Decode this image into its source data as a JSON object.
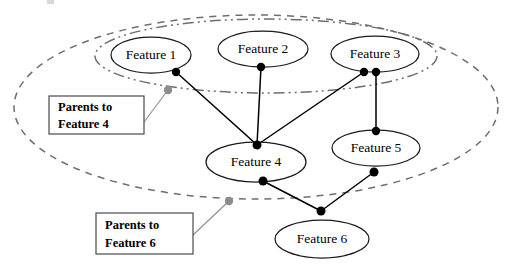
{
  "figure": {
    "kind": "bayesian-network-diagram",
    "width": 516,
    "height": 269,
    "background_color": "#ffffff"
  },
  "nodes": [
    {
      "id": "feature1",
      "label": "Feature 1",
      "cx": 151,
      "cy": 55,
      "rx": 40,
      "ry": 18
    },
    {
      "id": "feature2",
      "label": "Feature 2",
      "cx": 263,
      "cy": 49,
      "rx": 45,
      "ry": 18
    },
    {
      "id": "feature3",
      "label": "Feature 3",
      "cx": 375,
      "cy": 54,
      "rx": 44,
      "ry": 18
    },
    {
      "id": "feature4",
      "label": "Feature 4",
      "cx": 256,
      "cy": 162,
      "rx": 50,
      "ry": 20
    },
    {
      "id": "feature5",
      "label": "Feature 5",
      "cx": 376,
      "cy": 148,
      "rx": 44,
      "ry": 18
    },
    {
      "id": "feature6",
      "label": "Feature 6",
      "cx": 322,
      "cy": 239,
      "rx": 47,
      "ry": 19
    }
  ],
  "junction_points": [
    {
      "id": "jp-f1-bottom",
      "x": 176,
      "y": 72,
      "r": 4.2,
      "color": "#000000"
    },
    {
      "id": "jp-f2-bottom",
      "x": 261,
      "y": 67,
      "r": 4.2,
      "color": "#000000"
    },
    {
      "id": "jp-f3-bottom-left",
      "x": 364,
      "y": 72,
      "r": 4.2,
      "color": "#000000"
    },
    {
      "id": "jp-f3-bottom-right",
      "x": 376,
      "y": 72,
      "r": 4.2,
      "color": "#000000"
    },
    {
      "id": "jp-f4-top",
      "x": 257,
      "y": 145,
      "r": 4.5,
      "color": "#000000"
    },
    {
      "id": "jp-f4-bottom",
      "x": 263,
      "y": 181,
      "r": 4.5,
      "color": "#000000"
    },
    {
      "id": "jp-f5-top",
      "x": 376,
      "y": 131,
      "r": 4.2,
      "color": "#000000"
    },
    {
      "id": "jp-f5-bottom",
      "x": 374,
      "y": 172,
      "r": 4.5,
      "color": "#000000"
    },
    {
      "id": "jp-f6-top",
      "x": 321,
      "y": 211,
      "r": 4.5,
      "color": "#000000"
    }
  ],
  "edges": [
    {
      "id": "edge-f1-f4",
      "from": "feature1",
      "to": "feature4",
      "x1": 176,
      "y1": 72,
      "x2": 257,
      "y2": 145
    },
    {
      "id": "edge-f2-f4",
      "from": "feature2",
      "to": "feature4",
      "x1": 261,
      "y1": 67,
      "x2": 257,
      "y2": 145
    },
    {
      "id": "edge-f3-f4",
      "from": "feature3",
      "to": "feature4",
      "x1": 364,
      "y1": 72,
      "x2": 257,
      "y2": 145
    },
    {
      "id": "edge-f3-f5",
      "from": "feature3",
      "to": "feature5",
      "x1": 376,
      "y1": 72,
      "x2": 376,
      "y2": 131
    },
    {
      "id": "edge-f4-f6",
      "from": "feature4",
      "to": "feature6",
      "x1": 263,
      "y1": 181,
      "x2": 321,
      "y2": 211
    },
    {
      "id": "edge-f5-f6",
      "from": "feature5",
      "to": "feature6",
      "x1": 374,
      "y1": 172,
      "x2": 321,
      "y2": 211
    }
  ],
  "groups": [
    {
      "id": "parents-to-feature-6-group",
      "style": "dashed",
      "stroke_color": "#6e6e6e",
      "cx": 256,
      "cy": 107,
      "rx": 242,
      "ry": 92
    },
    {
      "id": "parents-to-feature-4-group",
      "style": "dash-dot-dot",
      "stroke_color": "#6e6e6e",
      "cx": 266,
      "cy": 56,
      "rx": 171,
      "ry": 37
    }
  ],
  "callouts": [
    {
      "id": "callout-parents-feature-4",
      "line1": "Parents to",
      "line2": "Feature 4",
      "box": {
        "x": 49,
        "y": 96,
        "w": 95,
        "h": 38
      },
      "anchor": {
        "x": 168,
        "y": 90,
        "r": 4.2,
        "color": "#8c8c8c"
      },
      "leader": {
        "x1": 144,
        "y1": 122,
        "x2": 168,
        "y2": 90
      }
    },
    {
      "id": "callout-parents-feature-6",
      "line1": "Parents to",
      "line2": "Feature 6",
      "box": {
        "x": 96,
        "y": 213,
        "w": 97,
        "h": 41
      },
      "anchor": {
        "x": 229,
        "y": 201,
        "r": 4.2,
        "color": "#8c8c8c"
      },
      "leader": {
        "x1": 193,
        "y1": 235,
        "x2": 229,
        "y2": 201
      }
    }
  ],
  "artifact": {
    "id": "top-edge-smudge",
    "x": 47,
    "y": 0,
    "w": 7,
    "h": 4
  }
}
